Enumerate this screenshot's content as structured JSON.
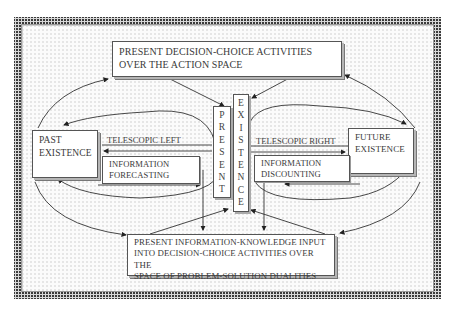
{
  "diagram": {
    "top_box": "PRESENT DECISION-CHOICE ACTIVITIES\nOVER THE ACTION SPACE",
    "past_box": "PAST\nEXISTENCE",
    "future_box": "FUTURE\nEXISTENCE",
    "present_vertical": [
      "P",
      "R",
      "E",
      "S",
      "E",
      "N",
      "T"
    ],
    "existence_vertical": [
      "E",
      "X",
      "I",
      "S",
      "T",
      "E",
      "N",
      "C",
      "E"
    ],
    "telescopic_left": "TELESCOPIC LEFT",
    "telescopic_right": "TELESCOPIC RIGHT",
    "info_forecasting": "INFORMATION\nFORECASTING",
    "info_discounting": "INFORMATION\nDISCOUNTING",
    "bottom_box": "PRESENT INFORMATION-KNOWLEDGE INPUT\nINTO DECISION-CHOICE ACTIVITIES OVER THE\nSPACE OF PROBLEM-SOLUTION DUALITIES"
  }
}
